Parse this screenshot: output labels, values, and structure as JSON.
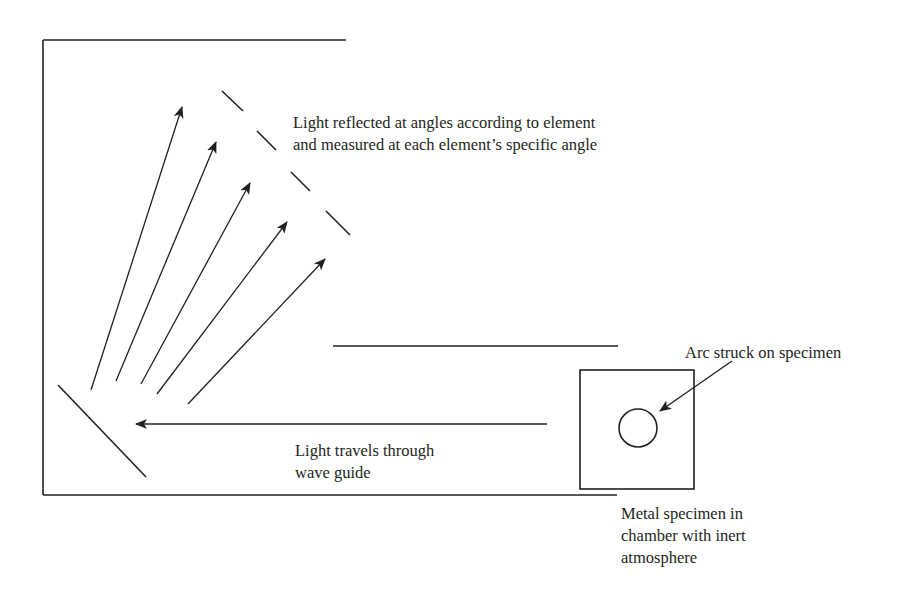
{
  "diagram": {
    "stroke_color": "#231f20",
    "background": "#ffffff",
    "labels": {
      "reflected_light": {
        "lines": [
          "Light reflected at angles according to element",
          "and measured  at each element’s specific angle"
        ]
      },
      "arc": {
        "lines": [
          "Arc struck on specimen"
        ]
      },
      "wave_guide": {
        "lines": [
          "Light travels through",
          "wave guide"
        ]
      },
      "specimen": {
        "lines": [
          "Metal specimen in",
          "chamber with inert",
          "atmosphere"
        ]
      }
    },
    "components": {
      "housing": {
        "top_line": {
          "x1": 43,
          "y1": 40,
          "x2": 346,
          "y2": 40
        },
        "left_line": {
          "x1": 43,
          "y1": 40,
          "x2": 43,
          "y2": 495
        },
        "bottom_line": {
          "x1": 43,
          "y1": 495,
          "x2": 617,
          "y2": 495
        }
      },
      "wave_guide_upper_wall": {
        "x1": 333,
        "y1": 346,
        "x2": 618,
        "y2": 346
      },
      "diffraction_grating": {
        "x1": 58,
        "y1": 385,
        "x2": 146,
        "y2": 477
      },
      "detectors": [
        {
          "x1": 222,
          "y1": 91,
          "x2": 243,
          "y2": 111
        },
        {
          "x1": 257,
          "y1": 131,
          "x2": 276,
          "y2": 150
        },
        {
          "x1": 291,
          "y1": 172,
          "x2": 310,
          "y2": 191
        },
        {
          "x1": 326,
          "y1": 211,
          "x2": 350,
          "y2": 235
        }
      ],
      "reflected_rays": [
        {
          "x1": 91,
          "y1": 390,
          "x2": 182,
          "y2": 107
        },
        {
          "x1": 116,
          "y1": 381,
          "x2": 216,
          "y2": 142
        },
        {
          "x1": 141,
          "y1": 384,
          "x2": 250,
          "y2": 183
        },
        {
          "x1": 157,
          "y1": 394,
          "x2": 287,
          "y2": 222
        },
        {
          "x1": 188,
          "y1": 404,
          "x2": 325,
          "y2": 259
        }
      ],
      "incident_ray": {
        "x1": 547,
        "y1": 424,
        "x2": 136,
        "y2": 424
      },
      "specimen_chamber": {
        "x": 580,
        "y": 370,
        "width": 114,
        "height": 119
      },
      "specimen_arc": {
        "cx": 638,
        "cy": 428,
        "r": 19
      },
      "arc_pointer": {
        "x1": 732,
        "y1": 361,
        "x2": 660,
        "y2": 411
      }
    }
  }
}
